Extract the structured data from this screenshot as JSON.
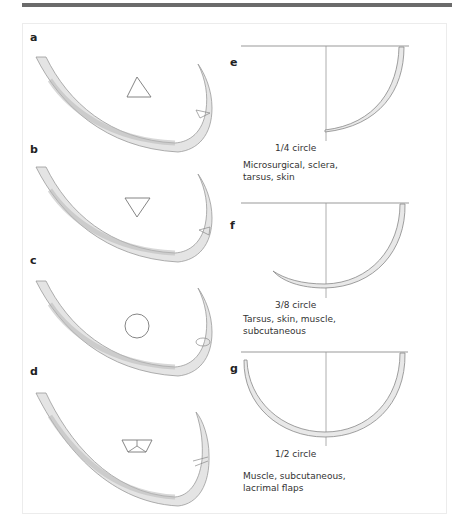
{
  "figure": {
    "colors": {
      "top_bar": "#6b6b6b",
      "frame_border": "#ececec",
      "line": "#888888",
      "needle_fill": "#e6e6e6",
      "needle_shadow": "#b5b5b5",
      "text": "#333333"
    },
    "left_panels": [
      {
        "label": "a",
        "cross_section": "triangle-up",
        "cross_section_name": "cutting needle"
      },
      {
        "label": "b",
        "cross_section": "triangle-down",
        "cross_section_name": "reverse cutting needle"
      },
      {
        "label": "c",
        "cross_section": "circle",
        "cross_section_name": "taper point needle"
      },
      {
        "label": "d",
        "cross_section": "trapezoid",
        "cross_section_name": "spatula needle"
      }
    ],
    "right_panels": [
      {
        "label": "e",
        "curvature": "1/4 circle",
        "uses": "Microsurgical, sclera,\ntarsus, skin"
      },
      {
        "label": "f",
        "curvature": "3/8 circle",
        "uses": "Tarsus, skin, muscle,\nsubcutaneous"
      },
      {
        "label": "g",
        "curvature": "1/2 circle",
        "uses": "Muscle, subcutaneous,\nlacrimal flaps"
      }
    ]
  }
}
